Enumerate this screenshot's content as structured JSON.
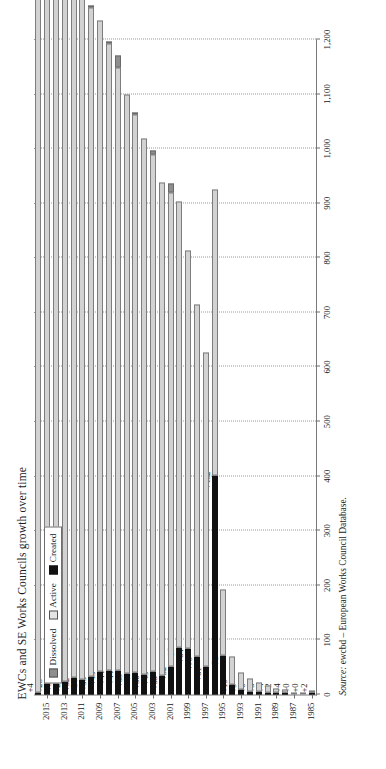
{
  "figure": {
    "title": "EWCs and SE Works Councils growth over time",
    "source_label": "Source:",
    "source_text": "ewcbd – European Works Council Database.",
    "page_number": ""
  },
  "legend": {
    "position": "top-left-inside",
    "items": [
      {
        "label": "Dissolved",
        "color": "#8e8e8e",
        "icon": "square-swatch"
      },
      {
        "label": "Active",
        "color": "#e4e4e4",
        "icon": "square-swatch"
      },
      {
        "label": "Created",
        "color": "#111111",
        "icon": "square-swatch"
      }
    ]
  },
  "chart_data": {
    "type": "bar",
    "orientation": "horizontal",
    "stacked": true,
    "title": "EWCs and SE Works Councils growth over time",
    "xlabel": "",
    "ylabel": "",
    "xlim": [
      0,
      1200
    ],
    "xticks": [
      0,
      100,
      200,
      300,
      400,
      500,
      600,
      700,
      800,
      900,
      1000,
      1100,
      1200
    ],
    "xticklabels": [
      "0",
      "100",
      "200",
      "300",
      "400",
      "500",
      "600",
      "700",
      "800",
      "900",
      "1,000",
      "1,100",
      "1,200"
    ],
    "grid": true,
    "categories": [
      1985,
      1986,
      1987,
      1988,
      1989,
      1990,
      1991,
      1992,
      1993,
      1994,
      1995,
      1996,
      1997,
      1998,
      1999,
      2000,
      2001,
      2002,
      2003,
      2004,
      2005,
      2006,
      2007,
      2008,
      2009,
      2010,
      2011,
      2012,
      2013,
      2014,
      2015,
      2016
    ],
    "categories_labelled": [
      "1985",
      "1987",
      "1989",
      "1991",
      "1993",
      "1995",
      "1997",
      "1999",
      "2001",
      "2003",
      "2005",
      "2007",
      "2009",
      "2011",
      "2013",
      "2015"
    ],
    "legend_position": "upper left",
    "series": [
      {
        "name": "Active",
        "color": "#d2d2d2",
        "values": [
          2,
          2,
          2,
          6,
          8,
          12,
          17,
          23,
          32,
          51,
          122,
          524,
          575,
          645,
          729,
          816,
          868,
          903,
          946,
          982,
          1022,
          1061,
          1105,
          1149,
          1192,
          1225,
          1253,
          1285,
          1309,
          1341,
          1369,
          1373
        ]
      },
      {
        "name": "Created",
        "color": "#111111",
        "values": [
          2,
          0,
          0,
          4,
          2,
          4,
          5,
          6,
          9,
          19,
          71,
          402,
          51,
          70,
          84,
          87,
          52,
          35,
          43,
          36,
          40,
          39,
          44,
          44,
          43,
          33,
          28,
          32,
          24,
          32,
          28,
          4
        ]
      },
      {
        "name": "Dissolved",
        "color": "#8e8e8e",
        "values": [
          0,
          0,
          0,
          0,
          0,
          0,
          0,
          0,
          0,
          0,
          0,
          0,
          0,
          0,
          0,
          0,
          17,
          0,
          7,
          0,
          1,
          0,
          22,
          1,
          0,
          5,
          0,
          8,
          0,
          4,
          0,
          0
        ]
      }
    ],
    "bar_labels": [
      "+2",
      "+0",
      "+0",
      "+4",
      "+2",
      "+4",
      "+5",
      "+6",
      "+9",
      "+19",
      "+71",
      "+402",
      "+51",
      "+70",
      "+84",
      "+87",
      "+52",
      "+35",
      "+43",
      "+36",
      "+40",
      "+39",
      "+44",
      "+44",
      "+43",
      "+33",
      "+28",
      "+32",
      "+24",
      "+32",
      "+28",
      "+4"
    ],
    "bar_totals": [
      4,
      2,
      2,
      10,
      10,
      16,
      22,
      29,
      41,
      70,
      193,
      926,
      626,
      715,
      813,
      903,
      937,
      938,
      996,
      1018,
      1063,
      1100,
      1171,
      1194,
      1235,
      1263,
      1281,
      1325,
      1333,
      1377,
      1397,
      1377
    ]
  }
}
